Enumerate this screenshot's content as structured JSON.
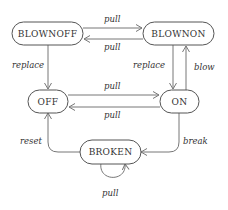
{
  "diagram": {
    "type": "state-machine",
    "colors": {
      "stroke": "#555555",
      "edge": "#777777",
      "text": "#333333",
      "background": "#ffffff"
    },
    "states": [
      {
        "id": "blownoff",
        "label": "BlownOff",
        "display": "BLOWNOFF"
      },
      {
        "id": "blownon",
        "label": "BlownOn",
        "display": "BLOWNON"
      },
      {
        "id": "off",
        "label": "Off",
        "display": "OFF"
      },
      {
        "id": "on",
        "label": "On",
        "display": "ON"
      },
      {
        "id": "broken",
        "label": "Broken",
        "display": "BROKEN"
      }
    ],
    "transitions": [
      {
        "from": "BlownOff",
        "to": "BlownOn",
        "label": "pull"
      },
      {
        "from": "BlownOn",
        "to": "BlownOff",
        "label": "pull"
      },
      {
        "from": "BlownOff",
        "to": "Off",
        "label": "replace"
      },
      {
        "from": "BlownOn",
        "to": "On",
        "label": "replace"
      },
      {
        "from": "On",
        "to": "BlownOn",
        "label": "blow"
      },
      {
        "from": "Off",
        "to": "On",
        "label": "pull"
      },
      {
        "from": "On",
        "to": "Off",
        "label": "pull"
      },
      {
        "from": "On",
        "to": "Broken",
        "label": "break"
      },
      {
        "from": "Broken",
        "to": "Off",
        "label": "reset"
      },
      {
        "from": "Broken",
        "to": "Broken",
        "label": "pull"
      }
    ]
  }
}
